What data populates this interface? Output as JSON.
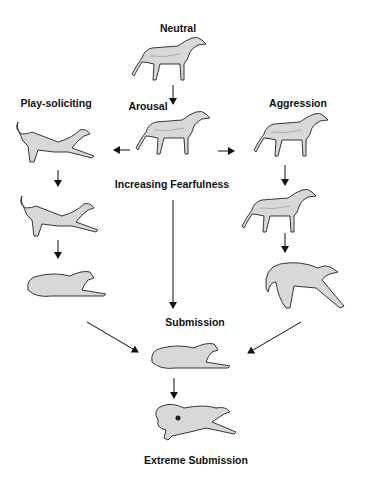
{
  "diagram": {
    "labels": {
      "neutral": "Neutral",
      "arousal": "Arousal",
      "play": "Play-soliciting",
      "aggression": "Aggression",
      "fear": "Increasing Fearfulness",
      "submission": "Submission",
      "extreme": "Extreme Submission"
    },
    "nodes": [
      {
        "id": "neutral",
        "posture": "standing"
      },
      {
        "id": "arousal",
        "posture": "alert-walking"
      },
      {
        "id": "play-1",
        "posture": "play-bow-start"
      },
      {
        "id": "play-2",
        "posture": "play-bow"
      },
      {
        "id": "play-3",
        "posture": "crouched-forward"
      },
      {
        "id": "aggr-1",
        "posture": "stiff-forward"
      },
      {
        "id": "aggr-2",
        "posture": "tail-low-snarl"
      },
      {
        "id": "aggr-3",
        "posture": "arched-back-snarl"
      },
      {
        "id": "submission",
        "posture": "lying-down"
      },
      {
        "id": "extreme",
        "posture": "lying-on-side"
      }
    ],
    "edges": [
      [
        "neutral",
        "arousal"
      ],
      [
        "arousal",
        "play-1"
      ],
      [
        "arousal",
        "aggr-1"
      ],
      [
        "play-1",
        "play-2"
      ],
      [
        "play-2",
        "play-3"
      ],
      [
        "aggr-1",
        "aggr-2"
      ],
      [
        "aggr-2",
        "aggr-3"
      ],
      [
        "arousal",
        "submission"
      ],
      [
        "play-3",
        "submission"
      ],
      [
        "aggr-3",
        "submission"
      ],
      [
        "submission",
        "extreme"
      ]
    ],
    "colors": {
      "ink": "#111111",
      "fill": "#d8d8d8",
      "shade": "#b5b5b5"
    }
  }
}
